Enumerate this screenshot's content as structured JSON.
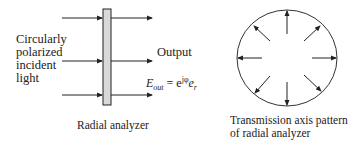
{
  "left_diagram": {
    "input_label_lines": [
      "Circularly",
      "polarized",
      "incident",
      "light"
    ],
    "output_label": "Output",
    "equation": {
      "lhs": "E",
      "lhs_sub": "out",
      "equals": "=",
      "base": "e",
      "exponent": "jφ",
      "vector": "e",
      "vector_sub": "r"
    },
    "caption": "Radial analyzer",
    "arrow_count": 3,
    "analyzer_fill": "#d9d9d9"
  },
  "right_diagram": {
    "caption_lines": [
      "Transmission axis pattern",
      "of radial analyzer"
    ],
    "arrow_count": 8,
    "arrow_direction": "radially outward"
  },
  "colors": {
    "line": "#222222",
    "analyzer_fill": "#d9d9d9"
  }
}
